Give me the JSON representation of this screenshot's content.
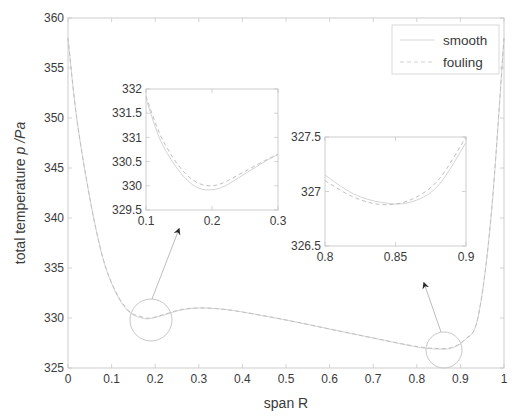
{
  "chart_data": {
    "type": "line",
    "title": "",
    "xlabel": "span R",
    "ylabel_prefix": "total temperature ",
    "ylabel_italic": "p /Pa",
    "xlim": [
      0,
      1
    ],
    "ylim": [
      325,
      360
    ],
    "xticks": [
      "0",
      "0.1",
      "0.2",
      "0.3",
      "0.4",
      "0.5",
      "0.6",
      "0.7",
      "0.8",
      "0.9",
      "1"
    ],
    "yticks": [
      "325",
      "330",
      "335",
      "340",
      "345",
      "350",
      "355",
      "360"
    ],
    "grid": false,
    "legend": {
      "position": "upper right",
      "entries": [
        "smooth",
        "fouling"
      ]
    },
    "series": [
      {
        "name": "smooth",
        "style": "solid",
        "x": [
          0.0,
          0.02,
          0.05,
          0.08,
          0.11,
          0.14,
          0.17,
          0.19,
          0.22,
          0.26,
          0.3,
          0.35,
          0.4,
          0.5,
          0.6,
          0.7,
          0.8,
          0.85,
          0.88,
          0.91,
          0.94,
          0.97,
          1.0
        ],
        "values": [
          358,
          350,
          342,
          336,
          332.5,
          330.6,
          330.0,
          329.95,
          330.3,
          330.8,
          331.0,
          330.9,
          330.6,
          329.8,
          328.9,
          328.0,
          327.1,
          326.9,
          327.0,
          327.8,
          330,
          340,
          358
        ]
      },
      {
        "name": "fouling",
        "style": "dashed",
        "x": [
          0.0,
          0.02,
          0.05,
          0.08,
          0.11,
          0.14,
          0.17,
          0.19,
          0.22,
          0.26,
          0.3,
          0.35,
          0.4,
          0.5,
          0.6,
          0.7,
          0.8,
          0.85,
          0.88,
          0.91,
          0.94,
          0.97,
          1.0
        ],
        "values": [
          358,
          350,
          342,
          336,
          332.6,
          330.7,
          330.1,
          330.0,
          330.35,
          330.85,
          331.0,
          330.9,
          330.6,
          329.8,
          328.9,
          328.0,
          327.15,
          326.95,
          327.05,
          327.85,
          330,
          340,
          358
        ]
      }
    ],
    "annotations": [
      {
        "type": "circle",
        "center": [
          0.19,
          330
        ],
        "label": "zoom region 1"
      },
      {
        "type": "circle",
        "center": [
          0.87,
          327
        ],
        "label": "zoom region 2"
      }
    ],
    "insets": [
      {
        "xlim": [
          0.1,
          0.3
        ],
        "ylim": [
          329.5,
          332
        ],
        "xticks": [
          "0.1",
          "0.2",
          "0.3"
        ],
        "yticks": [
          "329.5",
          "330",
          "330.5",
          "331",
          "331.5",
          "332"
        ],
        "series": [
          {
            "name": "smooth",
            "x": [
              0.1,
              0.12,
              0.14,
              0.16,
              0.18,
              0.2,
              0.22,
              0.25,
              0.28,
              0.3
            ],
            "values": [
              331.8,
              331.0,
              330.5,
              330.15,
              329.95,
              329.92,
              330.0,
              330.25,
              330.5,
              330.65
            ]
          },
          {
            "name": "fouling",
            "x": [
              0.1,
              0.12,
              0.14,
              0.16,
              0.18,
              0.2,
              0.22,
              0.25,
              0.28,
              0.3
            ],
            "values": [
              331.85,
              331.1,
              330.6,
              330.25,
              330.05,
              330.0,
              330.08,
              330.3,
              330.52,
              330.65
            ]
          }
        ]
      },
      {
        "xlim": [
          0.8,
          0.9
        ],
        "ylim": [
          326.5,
          327.5
        ],
        "xticks": [
          "0.8",
          "0.85",
          "0.9"
        ],
        "yticks": [
          "326.5",
          "327",
          "327.5"
        ],
        "series": [
          {
            "name": "smooth",
            "x": [
              0.8,
              0.82,
              0.84,
              0.86,
              0.88,
              0.9
            ],
            "values": [
              327.15,
              326.98,
              326.9,
              326.9,
              327.05,
              327.45
            ]
          },
          {
            "name": "fouling",
            "x": [
              0.8,
              0.82,
              0.84,
              0.86,
              0.88,
              0.9
            ],
            "values": [
              327.1,
              326.95,
              326.88,
              326.92,
              327.1,
              327.5
            ]
          }
        ]
      }
    ]
  },
  "colors": {
    "axis": "#c8c8c8",
    "text": "#3a3a3a",
    "smooth": "#d4d4d4",
    "fouling": "#c0c0c0",
    "arrow": "#2a2a2a"
  }
}
